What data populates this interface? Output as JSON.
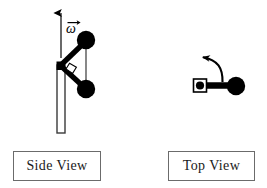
{
  "figure": {
    "background_color": "#ffffff",
    "ink_color": "#000000",
    "box_border_color": "#6b6b6b",
    "thin_line_color": "#4a4a4a"
  },
  "labels": {
    "side_view": "Side View",
    "top_view": "Top View"
  },
  "annotations": {
    "angular_velocity_symbol": "ω",
    "angular_velocity_vector_label": "ω⃗",
    "spin_axis_arrow": "up-arrow",
    "rotation_arrow": "curved-arrow-counterclockwise",
    "right_angle_marker": "right-angle-square"
  },
  "side_view": {
    "shaft": {
      "x_left": 57,
      "x_right": 65,
      "y_top": 65,
      "y_bottom": 133
    },
    "axis_arrow": {
      "x": 61,
      "y_tail": 58,
      "y_head": 10
    },
    "hinge": {
      "x": 61,
      "y": 65,
      "size": 7
    },
    "mass_upper": {
      "cx": 86,
      "cy": 40,
      "r": 9
    },
    "mass_lower": {
      "cx": 86,
      "cy": 89,
      "r": 9
    },
    "connector_thin": {
      "x": 86,
      "y_top": 40,
      "y_bottom": 89
    }
  },
  "top_view": {
    "hub": {
      "cx": 200,
      "cy": 85,
      "square": 13,
      "dot_r": 4
    },
    "arm": {
      "x_start": 203,
      "x_end": 234,
      "y": 85,
      "thickness": 6
    },
    "mass": {
      "cx": 236,
      "cy": 86,
      "r": 9
    },
    "rotation_arrow": {
      "start_x": 222,
      "start_y": 82,
      "end_x": 194,
      "end_y": 56,
      "direction": "counterclockwise"
    }
  }
}
